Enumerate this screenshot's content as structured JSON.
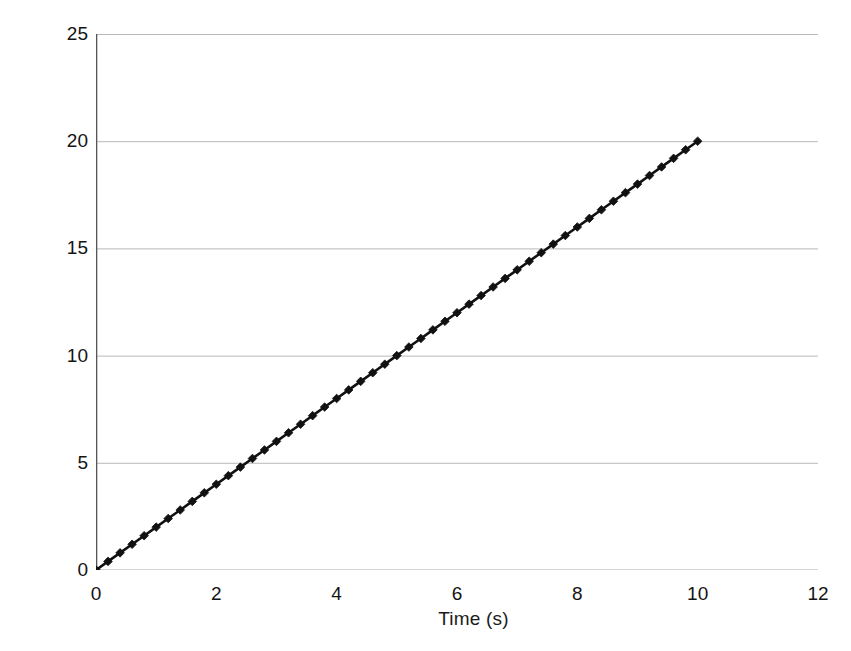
{
  "chart_data": {
    "type": "line",
    "title": "",
    "subtitle": "",
    "xlabel": "Time (s)",
    "ylabel": "Velocity (m/s)",
    "xlim": [
      0,
      12
    ],
    "ylim": [
      0,
      25
    ],
    "xticks": [
      "0",
      "2",
      "4",
      "6",
      "8",
      "10",
      "12"
    ],
    "xtick_values": [
      0,
      2,
      4,
      6,
      8,
      10,
      12
    ],
    "yticks": [
      "0",
      "5",
      "10",
      "15",
      "20",
      "25"
    ],
    "ytick_values": [
      0,
      5,
      10,
      15,
      20,
      25
    ],
    "grid": "horizontal",
    "legend": "none",
    "annotations": [],
    "series": [
      {
        "name": "velocity",
        "marker": "diamond",
        "color": "#111111",
        "line_color": "#111111",
        "x": [
          0,
          0.2,
          0.4,
          0.6,
          0.8,
          1,
          1.2,
          1.4,
          1.6,
          1.8,
          2,
          2.2,
          2.4,
          2.6,
          2.8,
          3,
          3.2,
          3.4,
          3.6,
          3.8,
          4,
          4.2,
          4.4,
          4.6,
          4.8,
          5,
          5.2,
          5.4,
          5.6,
          5.8,
          6,
          6.2,
          6.4,
          6.6,
          6.8,
          7,
          7.2,
          7.4,
          7.6,
          7.8,
          8,
          8.2,
          8.4,
          8.6,
          8.8,
          9,
          9.2,
          9.4,
          9.6,
          9.8,
          10
        ],
        "y": [
          0,
          0.4,
          0.8,
          1.2,
          1.6,
          2,
          2.4,
          2.8,
          3.2,
          3.6,
          4,
          4.4,
          4.8,
          5.2,
          5.6,
          6,
          6.4,
          6.8,
          7.2,
          7.6,
          8,
          8.4,
          8.8,
          9.2,
          9.6,
          10,
          10.4,
          10.8,
          11.2,
          11.6,
          12,
          12.4,
          12.8,
          13.2,
          13.6,
          14,
          14.4,
          14.8,
          15.2,
          15.6,
          16,
          16.4,
          16.8,
          17.2,
          17.6,
          18,
          18.4,
          18.8,
          19.2,
          19.6,
          20
        ]
      }
    ]
  },
  "colors": {
    "axis": "#555555",
    "grid": "#b9b9b9",
    "data": "#111111",
    "text": "#141414",
    "background": "#ffffff"
  }
}
